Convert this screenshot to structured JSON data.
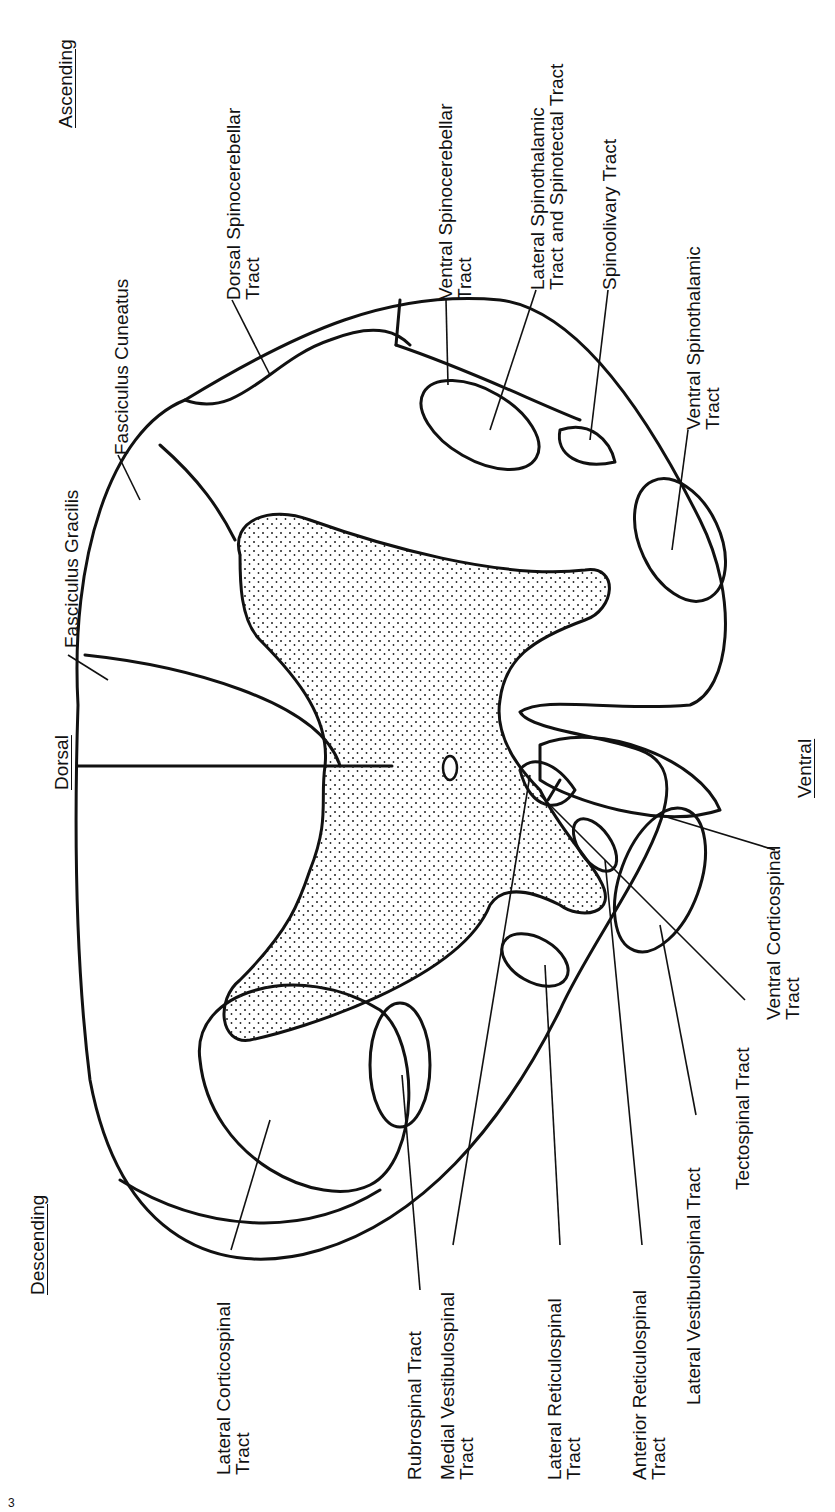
{
  "figure": {
    "page_mark": "3",
    "orientation_labels": {
      "dorsal": "Dorsal",
      "ventral": "Ventral",
      "ascending": "Ascending",
      "descending": "Descending"
    },
    "ascending_tracts": [
      {
        "line1": "Fasciculus Gracilis",
        "line2": ""
      },
      {
        "line1": "Fasciculus Cuneatus",
        "line2": ""
      },
      {
        "line1": "Dorsal Spinocerebellar",
        "line2": "Tract"
      },
      {
        "line1": "Ventral Spinocerebellar",
        "line2": "Tract"
      },
      {
        "line1": "Lateral Spinothalamic",
        "line2": "Tract and Spinotectal Tract"
      },
      {
        "line1": "Spinoolivary Tract",
        "line2": ""
      },
      {
        "line1": "Ventral Spinothalamic",
        "line2": "Tract"
      }
    ],
    "descending_tracts": [
      {
        "line1": "Lateral Corticospinal",
        "line2": "Tract"
      },
      {
        "line1": "Rubrospinal Tract",
        "line2": ""
      },
      {
        "line1": "Medial Vestibulospinal",
        "line2": "Tract"
      },
      {
        "line1": "Lateral Reticulospinal",
        "line2": "Tract"
      },
      {
        "line1": "Anterior Reticulospinal",
        "line2": "Tract"
      },
      {
        "line1": "Lateral Vestibulospinal Tract",
        "line2": ""
      },
      {
        "line1": "Tectospinal Tract",
        "line2": ""
      },
      {
        "line1": "Ventral Corticospinal",
        "line2": "Tract"
      }
    ]
  }
}
